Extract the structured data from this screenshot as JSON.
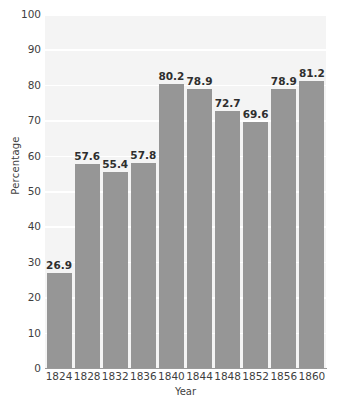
{
  "chart_data": {
    "type": "bar",
    "title": "",
    "xlabel": "Year",
    "ylabel": "Percentage",
    "categories": [
      "1824",
      "1828",
      "1832",
      "1836",
      "1840",
      "1844",
      "1848",
      "1852",
      "1856",
      "1860"
    ],
    "values": [
      26.9,
      57.6,
      55.4,
      57.8,
      80.2,
      78.9,
      72.7,
      69.6,
      78.9,
      81.2
    ],
    "value_labels": [
      "26.9",
      "57.6",
      "55.4",
      "57.8",
      "80.2",
      "78.9",
      "72.7",
      "69.6",
      "78.9",
      "81.2"
    ],
    "ylim": [
      0,
      100
    ],
    "ytick_labels": [
      "0",
      "10",
      "20",
      "30",
      "40",
      "50",
      "60",
      "70",
      "80",
      "90",
      "100"
    ],
    "ytick_values": [
      0,
      10,
      20,
      30,
      40,
      50,
      60,
      70,
      80,
      90,
      100
    ],
    "grid": true,
    "grid_orientation": "horizontal",
    "legend": false,
    "bar_color": "#969696",
    "plot_background": "#f4f4f4",
    "gridline_color": "#ffffff",
    "axis_color": "#9a9a9a",
    "text_color": "#3f3f3f"
  }
}
